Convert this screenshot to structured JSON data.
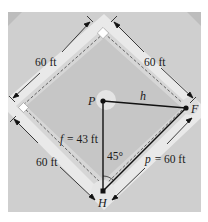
{
  "diagram": {
    "type": "baseball-diamond-geometry",
    "colors": {
      "frame": "#cfcfcf",
      "outfield": "#e9e9e9",
      "infield": "#c6c6c6",
      "mound": "#e4e4e4",
      "lines": "#111111",
      "base": "#ffffff"
    },
    "points": {
      "P": {
        "label": "P",
        "x": 103,
        "y": 101
      },
      "F": {
        "label": "F",
        "x": 186,
        "y": 108
      },
      "H": {
        "label": "H",
        "x": 103,
        "y": 191
      }
    },
    "dimension_labels": {
      "top_left": "60 ft",
      "top_right": "60 ft",
      "bottom_left": "60 ft",
      "bottom_right": "p = 60 ft"
    },
    "segment_labels": {
      "h": "h",
      "f": "f = 43 ft",
      "angle": "45°"
    },
    "equations": {
      "f_value": "43 ft",
      "p_value": "60 ft",
      "angle_value": "45°"
    }
  }
}
